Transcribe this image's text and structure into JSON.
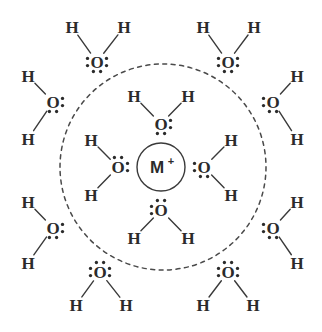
{
  "figure": {
    "type": "chemistry-structure-diagram",
    "background_color": "#ffffff",
    "line_color": "#3a3a3a",
    "text_color": "#2b2b2b"
  },
  "ion": {
    "symbol": "M",
    "charge": "+",
    "center_x": 161,
    "center_y": 167,
    "radius": 24
  },
  "hydration_shell": {
    "label": "dashed-boundary",
    "center_x": 163,
    "center_y": 167,
    "radius": 103,
    "style": "dashed"
  },
  "labels": {
    "oxygen": "O",
    "hydrogen": "H"
  },
  "inner_waters": [
    {
      "id": "inner-top",
      "ox": 161,
      "oy": 124,
      "hydrogens": [
        {
          "x": 134,
          "y": 96
        },
        {
          "x": 188,
          "y": 96
        }
      ],
      "lone_pairs": [
        "right",
        "bottom"
      ]
    },
    {
      "id": "inner-left",
      "ox": 118,
      "oy": 167,
      "hydrogens": [
        {
          "x": 91,
          "y": 140
        },
        {
          "x": 91,
          "y": 195
        }
      ],
      "lone_pairs": [
        "top",
        "right"
      ]
    },
    {
      "id": "inner-right",
      "ox": 204,
      "oy": 167,
      "hydrogens": [
        {
          "x": 231,
          "y": 140
        },
        {
          "x": 231,
          "y": 195
        }
      ],
      "lone_pairs": [
        "left",
        "bottom"
      ]
    },
    {
      "id": "inner-bottom",
      "ox": 161,
      "oy": 210,
      "hydrogens": [
        {
          "x": 134,
          "y": 238
        },
        {
          "x": 188,
          "y": 238
        }
      ],
      "lone_pairs": [
        "top",
        "left"
      ]
    }
  ],
  "outer_waters": [
    {
      "id": "outer-top-left",
      "ox": 97,
      "oy": 62,
      "hydrogens": [
        {
          "x": 72,
          "y": 27
        },
        {
          "x": 124,
          "y": 27
        }
      ],
      "lone_pairs": [
        "left",
        "right",
        "bottom"
      ]
    },
    {
      "id": "outer-top-right",
      "ox": 228,
      "oy": 62,
      "hydrogens": [
        {
          "x": 203,
          "y": 27
        },
        {
          "x": 254,
          "y": 27
        }
      ],
      "lone_pairs": [
        "left",
        "right",
        "bottom"
      ]
    },
    {
      "id": "outer-left-upper",
      "ox": 53,
      "oy": 102,
      "hydrogens": [
        {
          "x": 28,
          "y": 76
        },
        {
          "x": 28,
          "y": 139
        }
      ],
      "lone_pairs": [
        "right",
        "bottom"
      ]
    },
    {
      "id": "outer-right-upper",
      "ox": 273,
      "oy": 102,
      "hydrogens": [
        {
          "x": 297,
          "y": 76
        },
        {
          "x": 297,
          "y": 139
        }
      ],
      "lone_pairs": [
        "left",
        "bottom"
      ]
    },
    {
      "id": "outer-left-lower",
      "ox": 53,
      "oy": 228,
      "hydrogens": [
        {
          "x": 28,
          "y": 202
        },
        {
          "x": 28,
          "y": 263
        }
      ],
      "lone_pairs": [
        "right",
        "bottom"
      ]
    },
    {
      "id": "outer-right-lower",
      "ox": 273,
      "oy": 228,
      "hydrogens": [
        {
          "x": 297,
          "y": 202
        },
        {
          "x": 297,
          "y": 263
        }
      ],
      "lone_pairs": [
        "left",
        "bottom"
      ]
    },
    {
      "id": "outer-bottom-left",
      "ox": 100,
      "oy": 272,
      "hydrogens": [
        {
          "x": 76,
          "y": 305
        },
        {
          "x": 126,
          "y": 305
        }
      ],
      "lone_pairs": [
        "top",
        "left",
        "right"
      ]
    },
    {
      "id": "outer-bottom-right",
      "ox": 228,
      "oy": 272,
      "hydrogens": [
        {
          "x": 203,
          "y": 305
        },
        {
          "x": 253,
          "y": 305
        }
      ],
      "lone_pairs": [
        "top",
        "left",
        "right"
      ]
    }
  ]
}
